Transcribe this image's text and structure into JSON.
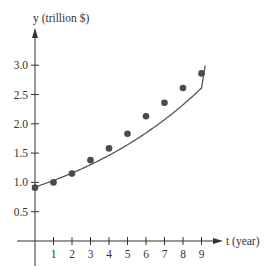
{
  "chart_data": {
    "type": "scatter",
    "title": "",
    "xlabel": "t (year)",
    "ylabel": "y (trillion $)",
    "x_ticks": [
      "1",
      "2",
      "3",
      "4",
      "5",
      "6",
      "7",
      "8",
      "9"
    ],
    "y_ticks": [
      "0.5",
      "1.0",
      "1.5",
      "2.0",
      "2.5",
      "3.0"
    ],
    "xlim": [
      0,
      10
    ],
    "ylim": [
      0,
      3.5
    ],
    "grid": false,
    "legend": null,
    "series": [
      {
        "name": "data points",
        "kind": "scatter",
        "x": [
          0,
          1,
          2,
          3,
          4,
          5,
          6,
          7,
          8,
          9
        ],
        "y": [
          0.91,
          1.0,
          1.15,
          1.38,
          1.58,
          1.83,
          2.13,
          2.36,
          2.61,
          2.86
        ]
      },
      {
        "name": "fitted curve",
        "kind": "line",
        "model": "exponential",
        "x": [
          0,
          1,
          2,
          3,
          4,
          5,
          6,
          7,
          8,
          9,
          9.2
        ],
        "y": [
          0.92,
          1.03,
          1.16,
          1.3,
          1.46,
          1.64,
          1.84,
          2.07,
          2.32,
          2.61,
          2.98
        ]
      }
    ]
  },
  "labels": {
    "y_axis": "y (trillion $)",
    "x_axis": "t (year)"
  },
  "colors": {
    "axis": "#333333",
    "points": "#4a4a4a",
    "curve": "#555555"
  }
}
